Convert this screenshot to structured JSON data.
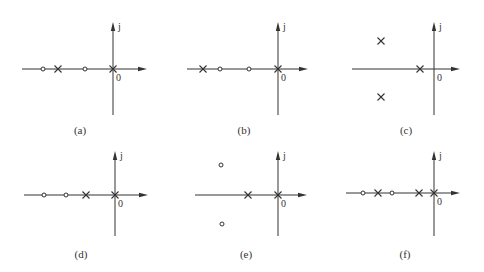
{
  "figure": {
    "axis_labels": {
      "imag": "j",
      "origin": "0"
    },
    "legend_glyphs": {
      "pole": "×",
      "zero": "○"
    },
    "colors": {
      "line": "#333333",
      "background": "#ffffff"
    },
    "panels": [
      {
        "id": "a",
        "caption": "(a)",
        "origin": [
          113,
          69
        ],
        "h_extent": [
          22,
          147
        ],
        "v_extent": [
          22,
          115
        ],
        "poles": [
          [
            58,
            69
          ],
          [
            113,
            69
          ]
        ],
        "zeros": [
          [
            43,
            69
          ],
          [
            85,
            69
          ]
        ],
        "caption_pos": [
          80,
          131
        ]
      },
      {
        "id": "b",
        "caption": "(b)",
        "origin": [
          278,
          69
        ],
        "h_extent": [
          187,
          308
        ],
        "v_extent": [
          22,
          115
        ],
        "poles": [
          [
            203,
            69
          ],
          [
            278,
            69
          ]
        ],
        "zeros": [
          [
            220,
            69
          ],
          [
            249,
            69
          ]
        ],
        "caption_pos": [
          244,
          131
        ]
      },
      {
        "id": "c",
        "caption": "(c)",
        "origin": [
          434,
          69
        ],
        "h_extent": [
          352,
          460
        ],
        "v_extent": [
          22,
          115
        ],
        "poles": [
          [
            420,
            69
          ],
          [
            381,
            41
          ],
          [
            381,
            97
          ]
        ],
        "zeros": [],
        "caption_pos": [
          406,
          131
        ]
      },
      {
        "id": "d",
        "caption": "(d)",
        "origin": [
          115,
          195
        ],
        "h_extent": [
          24,
          148
        ],
        "v_extent": [
          151,
          236
        ],
        "poles": [
          [
            86,
            195
          ],
          [
            115,
            195
          ]
        ],
        "zeros": [
          [
            44,
            195
          ],
          [
            66,
            195
          ]
        ],
        "caption_pos": [
          81,
          255
        ]
      },
      {
        "id": "e",
        "caption": "(e)",
        "origin": [
          278,
          195
        ],
        "h_extent": [
          195,
          307
        ],
        "v_extent": [
          151,
          236
        ],
        "poles": [
          [
            248,
            195
          ],
          [
            278,
            195
          ]
        ],
        "zeros": [
          [
            221,
            165
          ],
          [
            222,
            224
          ]
        ],
        "caption_pos": [
          246,
          255
        ]
      },
      {
        "id": "f",
        "caption": "(f)",
        "origin": [
          434,
          193
        ],
        "h_extent": [
          346,
          460
        ],
        "v_extent": [
          151,
          236
        ],
        "poles": [
          [
            378,
            193
          ],
          [
            419,
            193
          ],
          [
            434,
            193
          ]
        ],
        "zeros": [
          [
            363,
            193
          ],
          [
            392,
            193
          ]
        ],
        "caption_pos": [
          405,
          255
        ]
      }
    ]
  }
}
